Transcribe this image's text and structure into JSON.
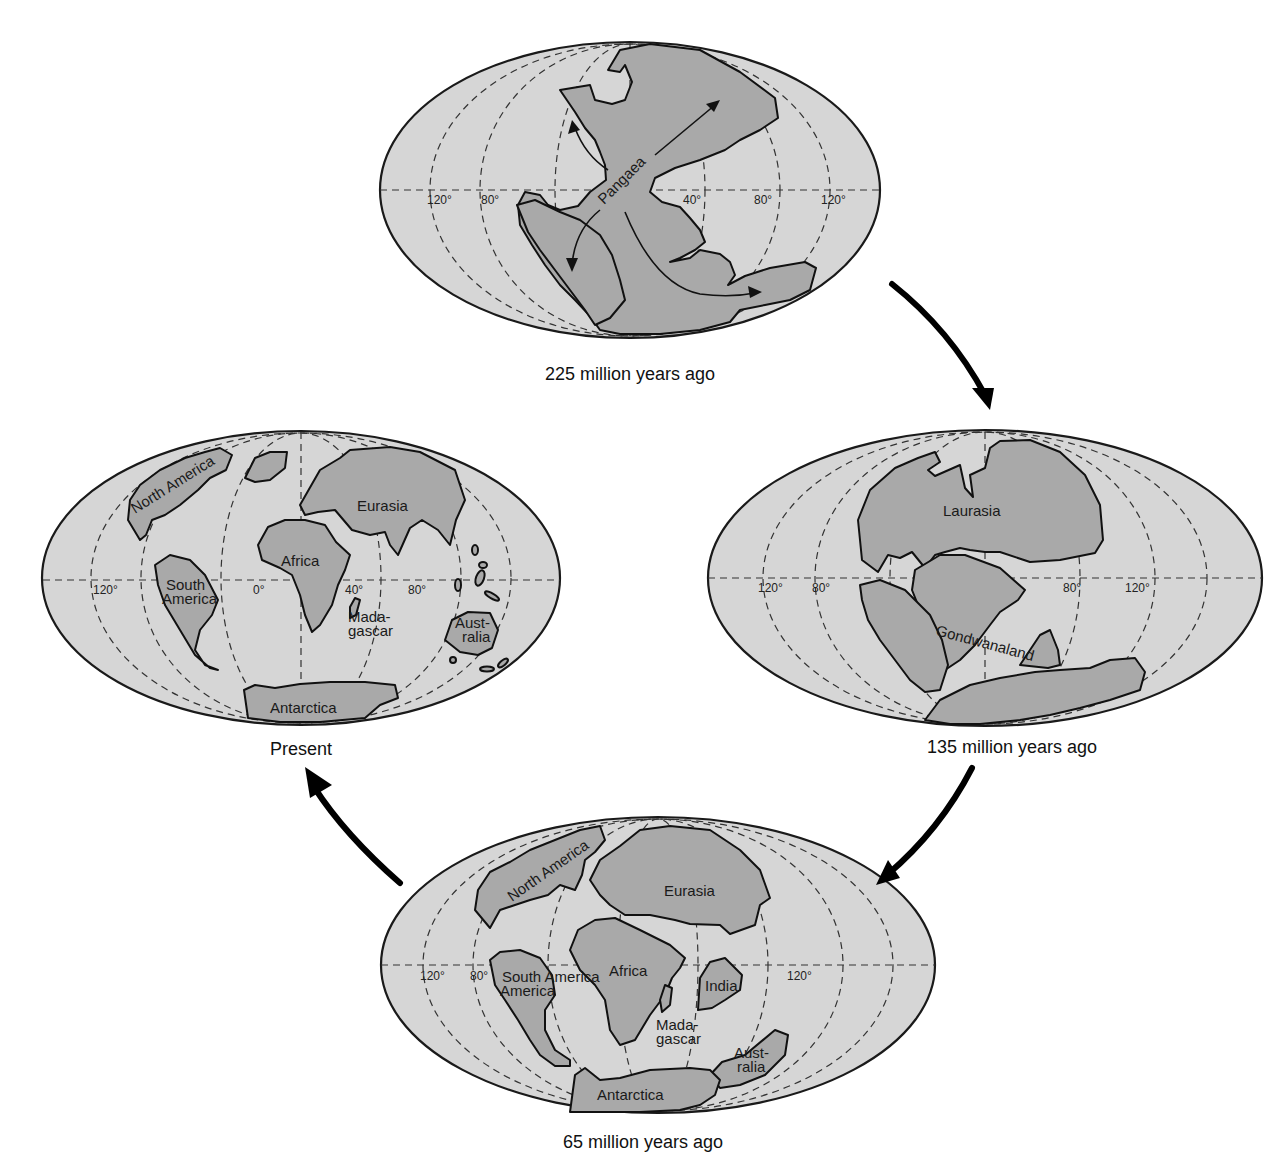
{
  "figure": {
    "colors": {
      "ocean": "#d6d6d6",
      "land": "#a9a9a9",
      "outline": "#111111",
      "background": "#ffffff"
    }
  },
  "maps": [
    {
      "id": "map-225",
      "caption": "225 million years ago",
      "continents": [
        "Pangaea"
      ],
      "degree_labels": [
        "120°",
        "80°",
        "40°",
        "80°",
        "120°"
      ]
    },
    {
      "id": "map-135",
      "caption": "135 million years ago",
      "continents": [
        "Laurasia",
        "Gondwanaland"
      ],
      "degree_labels": [
        "120°",
        "80°",
        "80°",
        "120°"
      ]
    },
    {
      "id": "map-65",
      "caption": "65 million years ago",
      "continents": [
        "North America",
        "Eurasia",
        "South America",
        "Africa",
        "India",
        "Mada-",
        "gascar",
        "Aust-",
        "ralia",
        "Antarctica"
      ],
      "degree_labels": [
        "120°",
        "80°",
        "120°"
      ]
    },
    {
      "id": "map-present",
      "caption": "Present",
      "continents": [
        "North America",
        "Eurasia",
        "Africa",
        "South",
        "America",
        "Mada-",
        "gascar",
        "Aust-",
        "ralia",
        "Antarctica"
      ],
      "degree_labels": [
        "120°",
        "0°",
        "40°",
        "80°"
      ]
    }
  ],
  "cycle_arrows": [
    {
      "from": "225 million years ago",
      "to": "135 million years ago",
      "icon": "curved-arrow-down-right"
    },
    {
      "from": "135 million years ago",
      "to": "65 million years ago",
      "icon": "curved-arrow-down-left"
    },
    {
      "from": "65 million years ago",
      "to": "Present",
      "icon": "curved-arrow-up-left"
    }
  ]
}
